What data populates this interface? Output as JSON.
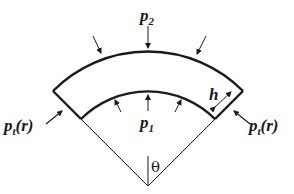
{
  "diagram": {
    "labels": {
      "outer_pressure": "p",
      "outer_pressure_sub": "2",
      "inner_pressure": "p",
      "inner_pressure_sub": "1",
      "thickness": "h",
      "tangential_left": "p",
      "tangential_left_sub": "t",
      "tangential_left_arg": "(r)",
      "tangential_right": "p",
      "tangential_right_sub": "t",
      "tangential_right_arg": "(r)",
      "angle": "θ"
    },
    "colors": {
      "stroke": "#1a1a1a",
      "background": "#ffffff"
    }
  }
}
